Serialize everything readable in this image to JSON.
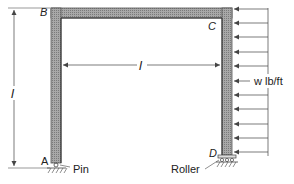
{
  "diagram": {
    "type": "portal-frame",
    "joints": {
      "A": "A",
      "B": "B",
      "C": "C",
      "D": "D"
    },
    "supports": {
      "left": "Pin",
      "right": "Roller"
    },
    "dimensions": {
      "height": "l",
      "span": "l"
    },
    "load": {
      "label": "w lb/ft",
      "arrow_count": 11,
      "direction": "left"
    },
    "colors": {
      "member_fill": "#9a9a9a",
      "member_edge": "#555555",
      "line": "#444444",
      "text": "#222222"
    }
  }
}
